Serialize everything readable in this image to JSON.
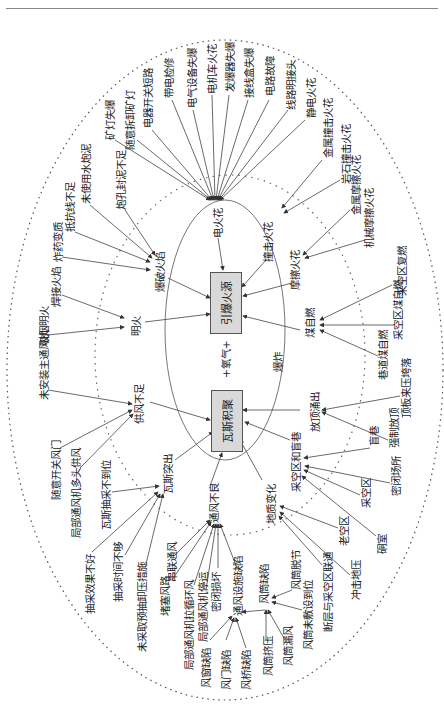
{
  "center": {
    "ignition_box": "引爆火源",
    "gas_box": "瓦斯积聚",
    "oxygen_label": "+氧气+",
    "explosion_label": "爆炸"
  },
  "mid_nodes": {
    "electric_spark": "电火花",
    "blasting_flame": "爆破火焰",
    "open_fire": "明火",
    "impact_spark": "撞击火花",
    "friction_spark": "摩擦火花",
    "coal_spontaneous": "煤自燃",
    "roof_gushing": "放顶涌出",
    "goaf_blind": "采空区和盲巷",
    "geology_change": "地质变化",
    "poor_ventilation": "通风不良",
    "gas_outburst": "瓦斯突出",
    "insufficient_air": "供风不足",
    "duct_defect": "风筒缺陷",
    "facility_defect": "通风设施缺陷"
  },
  "leaves": {
    "electric_spark": [
      "矿灯失爆",
      "随意拆卸矿灯",
      "电器开关短路",
      "带电检修",
      "电气设备失爆",
      "电机车火花",
      "发爆器失爆",
      "接线盒失爆",
      "电路故障",
      "线路明接头",
      "静电火花"
    ],
    "blasting_flame": [
      "炮孔封泥不足",
      "未使用水炮泥",
      "抵抗线不足",
      "炸药变质"
    ],
    "open_fire": [
      "焊接火焰",
      "吸烟明火"
    ],
    "impact_spark": [
      "金属撞击火花",
      "岩石撞击火花"
    ],
    "friction_spark": [
      "金属摩擦火花",
      "机械摩擦火花"
    ],
    "coal_spontaneous": [
      "采空区复燃",
      "采空区煤自燃",
      "巷道煤自燃"
    ],
    "roof_gushing": [
      "顶板来压垮落",
      "强制放顶"
    ],
    "goaf_blind": [
      "盲巷",
      "密闭场所",
      "采空区",
      "硐室"
    ],
    "geology_change": [
      "老空区",
      "冲击地压",
      "断层与采空区联通"
    ],
    "insufficient_air": [
      "未安装主通风机",
      "随意开关风门",
      "局部通风机多头供风"
    ],
    "gas_outburst": [
      "瓦斯抽采不到位",
      "抽采效果不好",
      "抽采时间不够",
      "未采取预抽卸压措施"
    ],
    "poor_ventilation": [
      "串联通风",
      "堵塞风路",
      "局部通风机拉循环风",
      "局部通风机停运",
      "密闭损坏"
    ],
    "facility_defect": [
      "风窗缺陷",
      "风门缺陷",
      "风桥缺陷"
    ],
    "duct_defect": [
      "风筒脱节",
      "风筒未敷设到位",
      "风筒挤压",
      "风筒漏风"
    ]
  }
}
